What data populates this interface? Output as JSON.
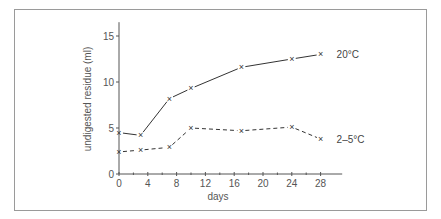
{
  "chart_data": {
    "type": "line",
    "title": "",
    "xlabel": "days",
    "ylabel": "undigested residue (ml)",
    "xlim": [
      0,
      31
    ],
    "ylim": [
      0,
      16.5
    ],
    "x_ticks": [
      0,
      4,
      8,
      12,
      16,
      20,
      24,
      28
    ],
    "x_tick_labels": [
      "0",
      "4",
      "8",
      "12",
      "16",
      "20",
      "24",
      "28"
    ],
    "x_minor_ticks": [
      2,
      6,
      10,
      14,
      18,
      22,
      26
    ],
    "y_ticks": [
      0,
      5,
      10,
      15
    ],
    "y_tick_labels": [
      "0",
      "5",
      "10",
      "15"
    ],
    "grid": false,
    "legend": "inline labels at line ends",
    "marker": "x",
    "series": [
      {
        "name": "20°C",
        "line_style": "solid",
        "x": [
          0,
          3,
          7,
          10,
          17,
          24,
          28
        ],
        "values": [
          4.5,
          4.2,
          8.2,
          9.3,
          11.6,
          12.5,
          13.0
        ]
      },
      {
        "name": "2–5°C",
        "line_style": "dashed",
        "x": [
          0,
          3,
          7,
          10,
          17,
          24,
          28
        ],
        "values": [
          2.4,
          2.6,
          2.9,
          5.0,
          4.7,
          5.1,
          3.8
        ]
      }
    ],
    "colors": {
      "line": "#333333",
      "axis": "#555555",
      "frame": "#9a9a9a"
    }
  }
}
